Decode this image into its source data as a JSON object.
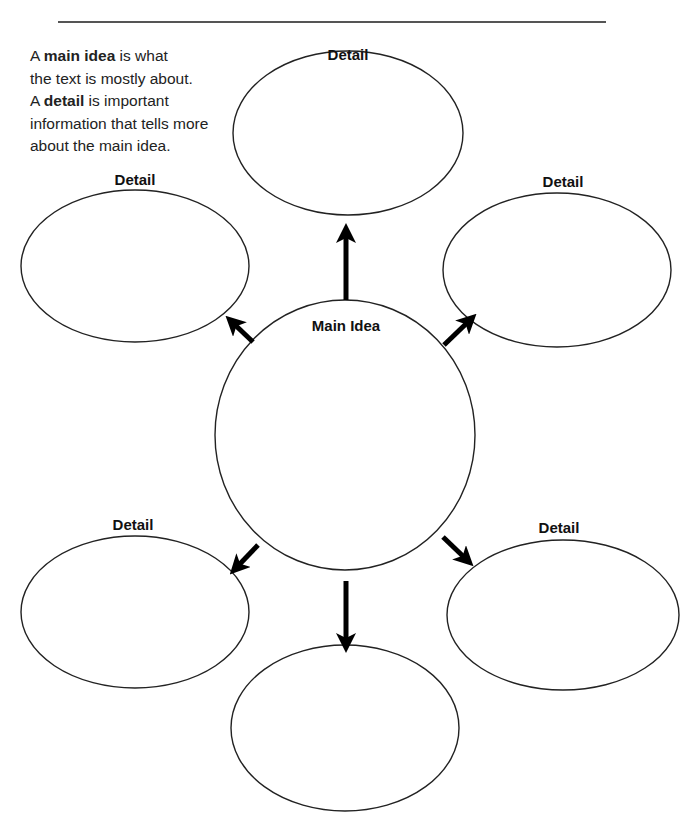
{
  "intro": {
    "line1_pre": "A ",
    "line1_bold": "main idea",
    "line1_post": " is what",
    "line2": "the text is mostly about.",
    "line3_pre": "A ",
    "line3_bold": "detail",
    "line3_post": " is important",
    "line4": "information that tells more",
    "line5": "about the main idea."
  },
  "center": {
    "label": "Main Idea"
  },
  "details": [
    {
      "position": "top",
      "label": "Detail"
    },
    {
      "position": "upper-left",
      "label": "Detail"
    },
    {
      "position": "upper-right",
      "label": "Detail"
    },
    {
      "position": "lower-left",
      "label": "Detail"
    },
    {
      "position": "lower-right",
      "label": "Detail"
    },
    {
      "position": "bottom",
      "label": ""
    }
  ]
}
